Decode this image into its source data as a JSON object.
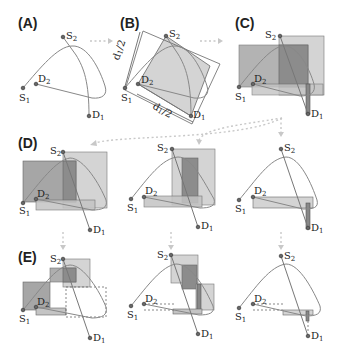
{
  "figure": {
    "panels": [
      {
        "id": "A",
        "label": "(A)"
      },
      {
        "id": "B",
        "label": "(B)",
        "annotations": [
          "d1/2",
          "d1/2"
        ]
      },
      {
        "id": "C",
        "label": "(C)"
      },
      {
        "id": "D",
        "label": "(D)"
      },
      {
        "id": "E",
        "label": "(E)"
      }
    ],
    "nodes": {
      "S1": {
        "base": "S",
        "sub": "1"
      },
      "S2": {
        "base": "S",
        "sub": "2"
      },
      "D1": {
        "base": "D",
        "sub": "1"
      },
      "D2": {
        "base": "D",
        "sub": "2"
      }
    },
    "annotation_d": {
      "base": "d",
      "sub": "1",
      "suffix": "/2"
    },
    "colors": {
      "light_box": "#d4d4d4",
      "mid_box": "#b3b3b3",
      "dark_box": "#8c8c8c",
      "curve": "#888888",
      "arrow": "#c8c8c8"
    }
  }
}
